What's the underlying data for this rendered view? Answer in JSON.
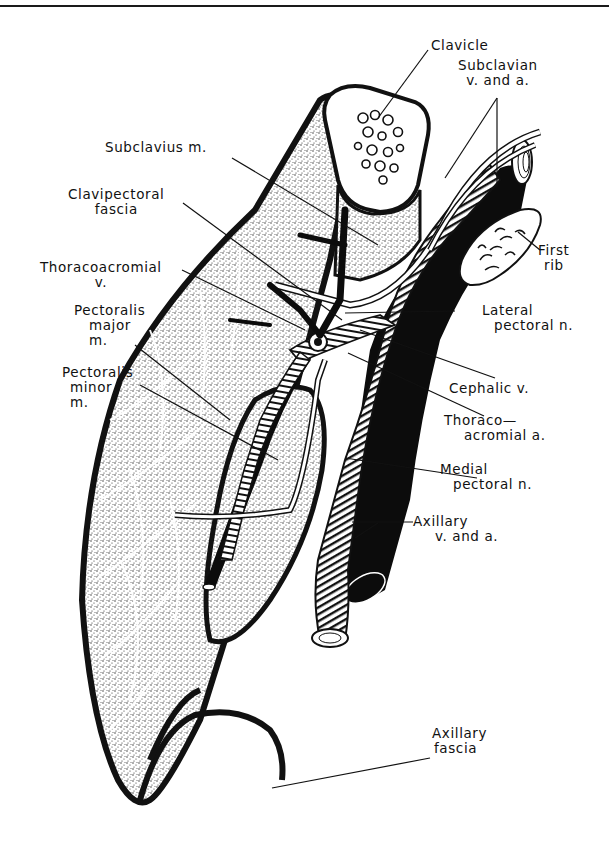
{
  "figure": {
    "type": "anatomical-illustration",
    "colors": {
      "ink": "#111111",
      "paper": "#ffffff",
      "stipple": "#9a9a9a"
    }
  },
  "labels": {
    "clavicle": {
      "line1": "Clavicle"
    },
    "subclavian": {
      "line1": "Subclavian",
      "line2": "v. and a."
    },
    "subclavius": {
      "line1": "Subclavius m."
    },
    "clavipectoral": {
      "line1": "Clavipectoral",
      "line2": "fascia"
    },
    "thoracoacromial_v": {
      "line1": "Thoracoacromial",
      "line2": "v."
    },
    "first_rib": {
      "line1": "First",
      "line2": "rib"
    },
    "pectoralis_major": {
      "line1": "Pectoralis",
      "line2": "major",
      "line3": "m."
    },
    "lateral_pectoral": {
      "line1": "Lateral",
      "line2": "pectoral n."
    },
    "pectoralis_minor": {
      "line1": "Pectoralis",
      "line2": "minor",
      "line3": "m."
    },
    "cephalic": {
      "line1": "Cephalic v."
    },
    "thoracoacromial_a": {
      "line1": "Thoraco—",
      "line2": "acromial a."
    },
    "medial_pectoral": {
      "line1": "Medial",
      "line2": "pectoral n."
    },
    "axillary_va": {
      "line1": "Axillary",
      "line2": "v. and a."
    },
    "axillary_fascia": {
      "line1": "Axillary",
      "line2": "fascia"
    }
  }
}
